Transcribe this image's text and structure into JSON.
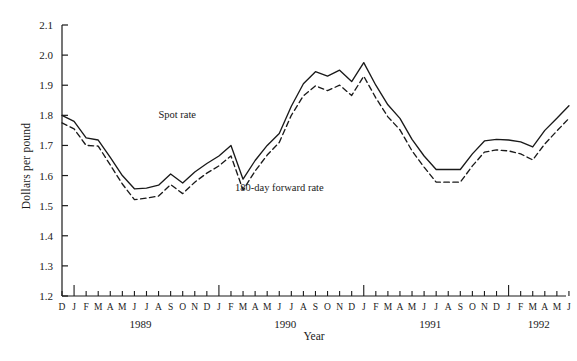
{
  "chart_data": {
    "type": "line",
    "title": "",
    "xlabel": "Year",
    "ylabel": "Dollars per pound",
    "ylim": [
      1.2,
      2.1
    ],
    "yticks": [
      "1.2",
      "1.3",
      "1.4",
      "1.5",
      "1.6",
      "1.7",
      "1.8",
      "1.9",
      "2.0",
      "2.1"
    ],
    "grid": false,
    "legend_position": "inline-annotation",
    "x": [
      "D",
      "J",
      "F",
      "M",
      "A",
      "M",
      "J",
      "J",
      "A",
      "S",
      "O",
      "N",
      "D",
      "J",
      "F",
      "M",
      "A",
      "M",
      "J",
      "J",
      "A",
      "S",
      "O",
      "N",
      "D",
      "J",
      "F",
      "M",
      "A",
      "M",
      "J",
      "J",
      "A",
      "S",
      "O",
      "N",
      "D",
      "J",
      "F",
      "M",
      "A",
      "M",
      "J"
    ],
    "year_groups": [
      {
        "label": "1989",
        "start_index": 1,
        "end_index": 12
      },
      {
        "label": "1990",
        "start_index": 13,
        "end_index": 24
      },
      {
        "label": "1991",
        "start_index": 25,
        "end_index": 36
      },
      {
        "label": "1992",
        "start_index": 37,
        "end_index": 42
      }
    ],
    "major_tick_indices": [
      1,
      13,
      25,
      37
    ],
    "series": [
      {
        "name": "Spot rate",
        "style": "solid",
        "color": "#1a1a1a",
        "values": [
          1.8,
          1.78,
          1.725,
          1.718,
          1.66,
          1.6,
          1.556,
          1.558,
          1.568,
          1.605,
          1.575,
          1.612,
          1.64,
          1.665,
          1.7,
          1.588,
          1.65,
          1.7,
          1.74,
          1.83,
          1.905,
          1.945,
          1.93,
          1.95,
          1.912,
          1.975,
          1.9,
          1.835,
          1.79,
          1.72,
          1.665,
          1.62,
          1.62,
          1.62,
          1.672,
          1.715,
          1.72,
          1.718,
          1.712,
          1.695,
          1.75,
          1.79,
          1.832
        ]
      },
      {
        "name": "180-day forward rate",
        "style": "dashed",
        "color": "#1a1a1a",
        "values": [
          1.775,
          1.755,
          1.7,
          1.698,
          1.635,
          1.572,
          1.52,
          1.525,
          1.532,
          1.57,
          1.54,
          1.578,
          1.608,
          1.632,
          1.665,
          1.552,
          1.615,
          1.668,
          1.71,
          1.8,
          1.865,
          1.898,
          1.882,
          1.9,
          1.866,
          1.93,
          1.858,
          1.795,
          1.752,
          1.682,
          1.628,
          1.578,
          1.578,
          1.578,
          1.632,
          1.678,
          1.685,
          1.682,
          1.672,
          1.652,
          1.705,
          1.748,
          1.79
        ]
      }
    ],
    "annotations": [
      {
        "text": "Spot rate",
        "x_px": 196,
        "y_px": 118
      },
      {
        "text": "180-day forward rate",
        "x_px": 235,
        "y_px": 191
      }
    ]
  }
}
